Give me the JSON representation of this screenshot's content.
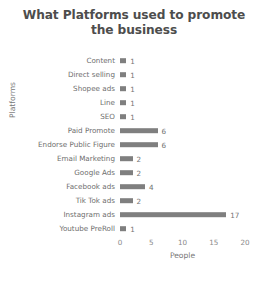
{
  "chart_data": {
    "type": "bar",
    "orientation": "horizontal",
    "title": "What Platforms used to promote the business",
    "title_line1": "What Platforms used to promote",
    "title_line2": "the business",
    "xlabel": "People",
    "ylabel": "Platforms",
    "categories": [
      "Content",
      "Direct selling",
      "Shopee ads",
      "Line",
      "SEO",
      "Paid Promote",
      "Endorse Public Figure",
      "Email Marketing",
      "Google Ads",
      "Facebook ads",
      "Tik Tok ads",
      "Instagram ads",
      "Youtube PreRoll"
    ],
    "values": [
      1,
      1,
      1,
      1,
      1,
      6,
      6,
      2,
      2,
      4,
      2,
      17,
      1
    ],
    "xlim": [
      0,
      20
    ],
    "xticks": [
      0,
      5,
      10,
      15,
      20
    ],
    "grid": false,
    "legend": "none",
    "bar_color": "#7f7f7f",
    "background_color": "#ffffff",
    "title_color": "#4d4d4d",
    "label_color": "#6e6e6e"
  }
}
